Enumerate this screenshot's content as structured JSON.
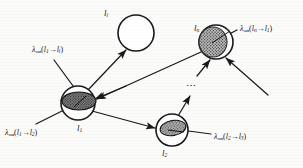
{
  "figure": {
    "background_color": "#fbfbfa",
    "ink_color": "#1a1a1a",
    "nodes": [
      {
        "id": "node-top",
        "label": "l",
        "label_sub": "i",
        "filled": false,
        "fill_color": "#ffffff",
        "cx": 136,
        "cy": 33,
        "r": 18
      },
      {
        "id": "node-left",
        "label": "l",
        "label_sub": "1",
        "filled": true,
        "fill_color": "#7a7a7a",
        "cx": 78,
        "cy": 103,
        "r": 17
      },
      {
        "id": "node-right",
        "label": "l",
        "label_sub": "n",
        "filled": true,
        "fill_color": "#9a9a9a",
        "cx": 216,
        "cy": 42,
        "r": 17
      },
      {
        "id": "node-bottom",
        "label": "l",
        "label_sub": "2",
        "filled": true,
        "fill_color": "#a8a8a8",
        "cx": 172,
        "cy": 130,
        "r": 16
      }
    ],
    "lambda_labels": [
      {
        "id": "lambda-l1-to-li",
        "symbol": "λ",
        "sub": "out",
        "from": "l",
        "from_sub": "1",
        "arrow": "→",
        "to": "l",
        "to_sub": "i",
        "x": 32,
        "y": 46
      },
      {
        "id": "lambda-l1-to-l2",
        "symbol": "λ",
        "sub": "out",
        "from": "l",
        "from_sub": "1",
        "arrow": "→",
        "to": "l",
        "to_sub": "2",
        "x": 5,
        "y": 129
      },
      {
        "id": "lambda-ln-to-l1",
        "symbol": "λ",
        "sub": "out",
        "from": "l",
        "from_sub": "n",
        "arrow": "→",
        "to": "l",
        "to_sub": "1",
        "x": 240,
        "y": 25
      },
      {
        "id": "lambda-l2-to-l3",
        "symbol": "λ",
        "sub": "out",
        "from": "l",
        "from_sub": "2",
        "arrow": "→",
        "to": "l",
        "to_sub": "3",
        "x": 214,
        "y": 133
      }
    ],
    "ellipsis": {
      "text": "⋯",
      "x": 190,
      "y": 86
    }
  }
}
